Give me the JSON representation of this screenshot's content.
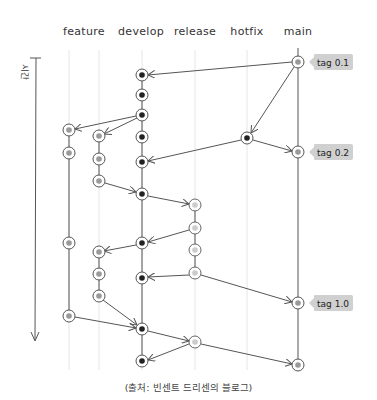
{
  "branches": [
    {
      "name": "feature",
      "label_x": 84
    },
    {
      "name": "develop",
      "label_x": 141
    },
    {
      "name": "release",
      "label_x": 195
    },
    {
      "name": "hotfix",
      "label_x": 247
    },
    {
      "name": "main",
      "label_x": 298
    }
  ],
  "lanes": {
    "feature1": 69,
    "feature2": 99,
    "develop": 142,
    "release": 195,
    "hotfix": 247,
    "main": 298
  },
  "time_axis": {
    "label": "시간"
  },
  "tags": [
    {
      "label": "tag 0.1",
      "y": 62
    },
    {
      "label": "tag 0.2",
      "y": 152
    },
    {
      "label": "tag 1.0",
      "y": 303
    }
  ],
  "caption": "(출처: 빈센트 드리센의 블로그)",
  "colors": {
    "line": "#555555",
    "guide": "#e4e4e4",
    "develop_dot": "#222222",
    "feature_dot": "#999999",
    "release_dot": "#cccccc",
    "main_dot": "#999999",
    "tag_bg": "#d0d0d0"
  },
  "nodes": {
    "main": [
      62,
      152,
      303,
      365
    ],
    "hotfix": [
      138
    ],
    "develop": [
      75,
      95,
      115,
      137,
      162,
      194,
      243,
      278,
      329,
      361
    ],
    "release": [
      205,
      228,
      250,
      273,
      342
    ],
    "feature1": [
      130,
      153,
      243,
      316
    ],
    "feature2": [
      136,
      159,
      181,
      252,
      274,
      296
    ]
  }
}
